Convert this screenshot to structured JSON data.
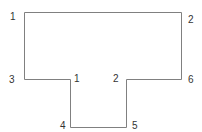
{
  "diagram": {
    "type": "T-shaped outline with numbered vertices",
    "stroke_color": "#808080",
    "label_color": "#333333",
    "outline_points": [
      [
        24.5,
        12.5
      ],
      [
        181.5,
        12.5
      ],
      [
        181.5,
        79.5
      ],
      [
        126.5,
        79.5
      ],
      [
        126.5,
        127.5
      ],
      [
        70.5,
        127.5
      ],
      [
        70.5,
        79.5
      ],
      [
        24.5,
        79.5
      ]
    ],
    "labels": [
      {
        "text": "1",
        "x": 10,
        "y": 20
      },
      {
        "text": "2",
        "x": 188,
        "y": 23
      },
      {
        "text": "3",
        "x": 9,
        "y": 83
      },
      {
        "text": "1",
        "x": 74,
        "y": 82
      },
      {
        "text": "2",
        "x": 113,
        "y": 82
      },
      {
        "text": "6",
        "x": 188,
        "y": 83
      },
      {
        "text": "4",
        "x": 60,
        "y": 129
      },
      {
        "text": "5",
        "x": 132,
        "y": 129
      }
    ]
  }
}
